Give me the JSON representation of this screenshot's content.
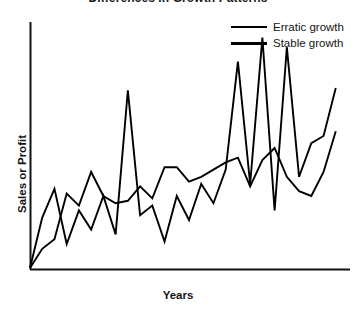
{
  "chart_data": {
    "type": "line",
    "title": "Differences in Growth Patterns",
    "xlabel": "Years",
    "ylabel": "Sales or Profit",
    "grid": false,
    "legend_position": "top-right",
    "axes": {
      "x_axis_visible": true,
      "y_axis_visible": true,
      "x_tick_labels": [],
      "y_tick_labels": [],
      "xlim": [
        0,
        26
      ],
      "ylim": [
        0,
        100
      ]
    },
    "series": [
      {
        "name": "Erratic growth",
        "color": "#000000",
        "x": [
          0,
          1,
          2,
          3,
          4,
          5,
          6,
          7,
          8,
          9,
          10,
          11,
          12,
          13,
          14,
          15,
          16,
          17,
          18,
          19,
          20,
          21,
          22,
          23,
          24,
          25
        ],
        "values": [
          0,
          21,
          33,
          10,
          24,
          16,
          30,
          14,
          74,
          22,
          26,
          11,
          30,
          20,
          35,
          27,
          41,
          86,
          35,
          96,
          24,
          92,
          38,
          52,
          55,
          75
        ]
      },
      {
        "name": "Stable growth",
        "color": "#000000",
        "x": [
          0,
          1,
          2,
          3,
          4,
          5,
          6,
          7,
          8,
          9,
          10,
          11,
          12,
          13,
          14,
          15,
          16,
          17,
          18,
          19,
          20,
          21,
          22,
          23,
          24,
          25
        ],
        "values": [
          0,
          8,
          12,
          31,
          26,
          40,
          30,
          27,
          28,
          34,
          29,
          42,
          42,
          36,
          38,
          41,
          44,
          46,
          34,
          45,
          50,
          38,
          32,
          30,
          40,
          57
        ]
      }
    ]
  },
  "legend": {
    "items": [
      {
        "label": "Erratic growth",
        "swatch": "erratic"
      },
      {
        "label": "Stable growth",
        "swatch": "stable"
      }
    ]
  }
}
